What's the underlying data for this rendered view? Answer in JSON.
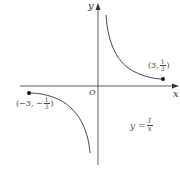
{
  "diagram": {
    "axes": {
      "x_label": "x",
      "y_label": "y",
      "origin_label": "O"
    },
    "points": [
      {
        "label_prefix": "(3, ",
        "num": "1",
        "den": "3",
        "label_suffix": ")"
      },
      {
        "label_prefix": "(−3, −",
        "num": "1",
        "den": "3",
        "label_suffix": ")"
      }
    ],
    "equation": {
      "lhs": "y = ",
      "num": "1",
      "den": "x"
    }
  },
  "colors": {
    "stroke": "#333333",
    "text": "#444444"
  }
}
